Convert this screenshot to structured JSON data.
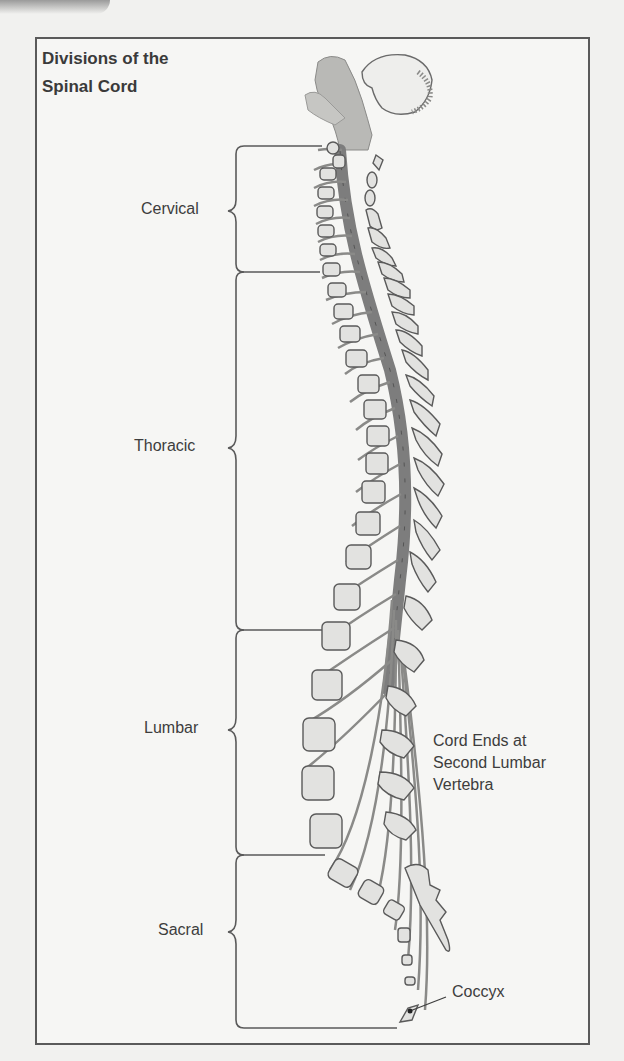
{
  "title": {
    "line1": "Divisions of the",
    "line2": "Spinal Cord"
  },
  "divisions": [
    {
      "label": "Cervical",
      "bracket_top": 145,
      "bracket_bottom": 272
    },
    {
      "label": "Thoracic",
      "bracket_top": 272,
      "bracket_bottom": 630
    },
    {
      "label": "Lumbar",
      "bracket_top": 630,
      "bracket_bottom": 855
    },
    {
      "label": "Sacral",
      "bracket_top": 855,
      "bracket_bottom": 1028
    }
  ],
  "annotations": {
    "cord_end": {
      "line1": "Cord Ends at",
      "line2": "Second Lumbar",
      "line3": "Vertebra"
    },
    "coccyx": "Coccyx"
  },
  "colors": {
    "line": "#5a5a5a",
    "cord": "#7d7d7d",
    "vertebra_fill": "#e2e2e0",
    "text": "#3d3d3d"
  }
}
